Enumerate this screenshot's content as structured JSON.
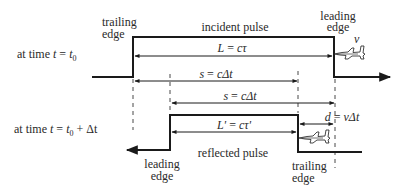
{
  "diagram": {
    "type": "radar-pulse-reflection",
    "colors": {
      "line": "#1a1a1a",
      "text": "#2a2a2a",
      "background": "#ffffff"
    },
    "rows": [
      {
        "id": "incident",
        "time_label": {
          "prefix": "at time ",
          "var": "t",
          "eq": " = ",
          "rhs": "t",
          "sub": "0",
          "suffix": ""
        },
        "pulse_label": "incident pulse",
        "left_edge_label": [
          "trailing",
          "edge"
        ],
        "right_edge_label": [
          "leading",
          "edge"
        ],
        "velocity_label": "v"
      },
      {
        "id": "reflected",
        "time_label": {
          "prefix": "at time ",
          "var": "t",
          "eq": " = ",
          "rhs": "t",
          "sub": "0",
          "suffix": " + Δt"
        },
        "pulse_label": "reflected pulse",
        "left_edge_label": [
          "leading",
          "edge"
        ],
        "right_edge_label": [
          "trailing",
          "edge"
        ]
      }
    ],
    "dimensions": [
      {
        "id": "L",
        "lhs": "L",
        "rhs": "cτ"
      },
      {
        "id": "s1",
        "lhs": "s",
        "rhs": "cΔt"
      },
      {
        "id": "s2",
        "lhs": "s",
        "rhs": "cΔt"
      },
      {
        "id": "Lprime",
        "lhs": "L'",
        "rhs": "cτ'"
      },
      {
        "id": "d",
        "lhs": "d",
        "rhs": "vΔt"
      }
    ],
    "icons": [
      "aircraft-icon",
      "aircraft-icon"
    ]
  }
}
